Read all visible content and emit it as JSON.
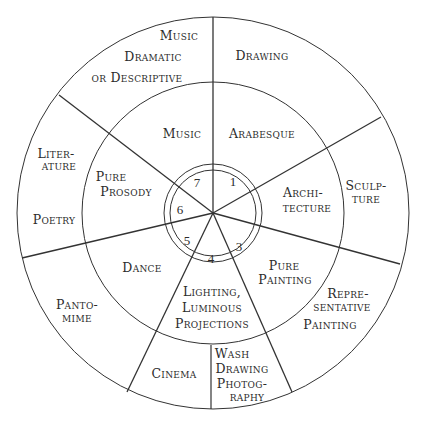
{
  "diagram": {
    "type": "radial-wheel",
    "center": [
      213,
      213
    ],
    "rings": {
      "outer_radius": 196,
      "middle_radius": 131,
      "inner_outer_radius": 49,
      "inner_inner_radius": 43
    },
    "line_color": "#333333",
    "text_color": "#2b2b2b",
    "segments": [
      {
        "number": "1",
        "inner_label": [
          "Arabesque"
        ],
        "outer_label": [
          "Drawing"
        ]
      },
      {
        "number": "2",
        "inner_label": [
          "Archi-",
          "tecture"
        ],
        "outer_label": [
          "Sculp-",
          "ture"
        ]
      },
      {
        "number": "3",
        "inner_label": [
          "Pure",
          "Painting"
        ],
        "outer_label": [
          "Repre-",
          "sentative",
          "Painting"
        ]
      },
      {
        "number": "4",
        "inner_label": [
          "Lighting,",
          "Luminous",
          "Projections"
        ],
        "outer_label_left": [
          "Cinema"
        ],
        "outer_label_right": [
          "Wash",
          "Drawing",
          "Photog-",
          "raphy"
        ]
      },
      {
        "number": "5",
        "inner_label": [
          "Dance"
        ],
        "outer_label": [
          "Panto-",
          "mime"
        ]
      },
      {
        "number": "6",
        "inner_label": [
          "Pure",
          "Prosody"
        ],
        "outer_label": [
          "Liter-",
          "ature",
          "Poetry"
        ]
      },
      {
        "number": "7",
        "inner_label": [
          "Music"
        ],
        "outer_label": [
          "Music",
          "Dramatic",
          "or Descriptive"
        ]
      }
    ]
  },
  "labels": {
    "n1": "1",
    "n3": "3",
    "n4": "4",
    "n5": "5",
    "n6": "6",
    "n7": "7",
    "music_outer_1": "Music",
    "music_outer_2": "Dramatic",
    "music_outer_3": "or Descriptive",
    "drawing": "Drawing",
    "music_inner": "Music",
    "arabesque": "Arabesque",
    "literature_1": "Liter-",
    "literature_2": "ature",
    "poetry": "Poetry",
    "pure_prosody_1": "Pure",
    "pure_prosody_2": "Prosody",
    "architecture_1": "Archi-",
    "architecture_2": "tecture",
    "sculpture_1": "Sculp-",
    "sculpture_2": "ture",
    "dance": "Dance",
    "pure_painting_1": "Pure",
    "pure_painting_2": "Painting",
    "pantomime_1": "Panto-",
    "pantomime_2": "mime",
    "lighting_1": "Lighting,",
    "lighting_2": "Luminous",
    "lighting_3": "Projections",
    "repr_1": "Repre-",
    "repr_2": "sentative",
    "repr_3": "Painting",
    "cinema": "Cinema",
    "wash_1": "Wash",
    "wash_2": "Drawing",
    "wash_3": "Photog-",
    "wash_4": "raphy"
  }
}
